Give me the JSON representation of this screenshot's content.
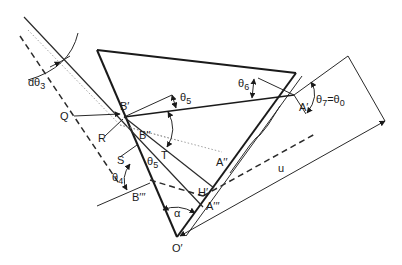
{
  "diagram": {
    "labels": {
      "d_theta3": "dθ",
      "d_theta3_sub": "3",
      "Q": "Q",
      "R": "R",
      "S": "S",
      "T": "T",
      "B_prime": "B′",
      "B_dprime": "B′′",
      "B_tprime": "B′′′",
      "A_prime": "A′",
      "A_dprime": "A′′",
      "A_tprime": "A′′′",
      "H_prime": "H′",
      "O_prime": "O′",
      "alpha": "α",
      "u": "u",
      "theta4": "θ",
      "theta4_sub": "4",
      "theta5_top": "θ",
      "theta5_top_sub": "5",
      "theta5_low": "θ",
      "theta5_low_sub": "5",
      "theta6": "θ",
      "theta6_sub": "6",
      "theta7": "θ",
      "theta7_sub": "7",
      "theta7_eq": "=θ",
      "theta0_sub": "0"
    },
    "colors": {
      "line": "#1a1a1a",
      "dotted": "#8a8a8a",
      "background": "#ffffff"
    }
  }
}
